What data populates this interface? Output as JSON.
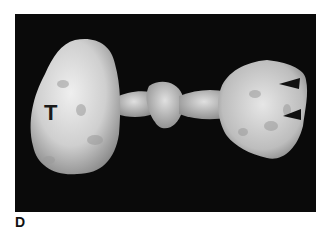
{
  "figure": {
    "panel_label": "D",
    "photo": {
      "description": "Gross pathology specimen on black background",
      "background_color": "#0a0a0a",
      "tissue_color": "#d8d8d8",
      "annotations": {
        "tumor_label": "T",
        "arrowheads": [
          {
            "name": "arrowhead-upper",
            "direction": "left"
          },
          {
            "name": "arrowhead-lower",
            "direction": "left"
          }
        ]
      }
    }
  }
}
